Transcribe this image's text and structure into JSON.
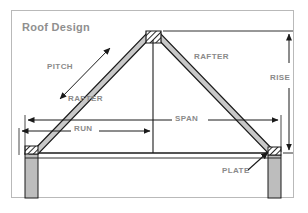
{
  "diagram": {
    "title": "Roof Design",
    "type": "technical-drawing",
    "labels": {
      "pitch": "PITCH",
      "rafter_left": "RAFTER",
      "rafter_right": "RAFTER",
      "rise": "RISE",
      "span": "SPAN",
      "run": "RUN",
      "plate": "PLATE"
    },
    "colors": {
      "frame_border": "#b9b9b9",
      "background": "#ffffff",
      "text": "#8a8a8a",
      "title_text": "#8f8f8f",
      "line": "#1a1a1a",
      "member_fill": "#c8c8c8",
      "wall_fill": "#bdbdbd",
      "hatch": "#2b2b2b"
    },
    "parts": [
      {
        "name": "ridge-block",
        "note": "cross-hatched block at apex"
      },
      {
        "name": "left-rafter",
        "note": "sloping member from left plate to ridge"
      },
      {
        "name": "right-rafter",
        "note": "sloping member from ridge to right plate"
      },
      {
        "name": "left-plate",
        "note": "cross-hatched top plate on left wall"
      },
      {
        "name": "right-plate",
        "note": "cross-hatched top plate on right wall"
      },
      {
        "name": "left-wall",
        "note": "vertical stud wall below left plate"
      },
      {
        "name": "right-wall",
        "note": "vertical stud wall below right plate"
      },
      {
        "name": "center-post",
        "note": "vertical centerline from ridge to ceiling"
      },
      {
        "name": "ceiling-joist",
        "note": "horizontal member between plates"
      }
    ],
    "dimensions": [
      {
        "name": "rise",
        "orientation": "vertical",
        "label": "RISE",
        "note": "apex height above plate line, right side"
      },
      {
        "name": "span",
        "orientation": "horizontal",
        "label": "SPAN",
        "note": "full width, outside of wall to outside of wall"
      },
      {
        "name": "run",
        "orientation": "horizontal",
        "label": "RUN",
        "note": "half of span, left wall to centerline"
      },
      {
        "name": "pitch",
        "orientation": "diagonal",
        "label": "PITCH",
        "note": "double-headed arrow parallel to left rafter"
      }
    ],
    "callouts": [
      {
        "name": "plate",
        "label": "PLATE",
        "note": "leader arrow pointing to right top plate"
      }
    ]
  }
}
